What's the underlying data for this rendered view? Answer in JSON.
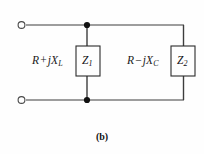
{
  "figure": {
    "caption": "(b)",
    "background_color": "#fefefe",
    "wire_color": "#3d3d3d",
    "box_border_color": "#2b2b2b",
    "text_color": "#111111"
  },
  "branches": [
    {
      "id": "branch-1",
      "impedance_expression": {
        "resistance": "R",
        "operator": "+",
        "reactance_symbol": "jX",
        "reactance_subscript": "L",
        "full_text": "R + jX_L"
      },
      "box_label": {
        "symbol": "Z",
        "subscript": "1",
        "full_text": "Z₁"
      }
    },
    {
      "id": "branch-2",
      "impedance_expression": {
        "resistance": "R",
        "operator": "−",
        "reactance_symbol": "jX",
        "reactance_subscript": "C",
        "full_text": "R − jX_C"
      },
      "box_label": {
        "symbol": "Z",
        "subscript": "2",
        "full_text": "Z₂"
      }
    }
  ],
  "terminals": [
    {
      "name": "terminal-top-left",
      "x": 21,
      "y": 25,
      "style": "open-circle"
    },
    {
      "name": "terminal-bottom-left",
      "x": 21,
      "y": 100,
      "style": "open-circle"
    }
  ],
  "junctions": [
    {
      "name": "junction-top",
      "x": 87,
      "y": 25,
      "style": "filled-dot"
    },
    {
      "name": "junction-bottom",
      "x": 87,
      "y": 100,
      "style": "filled-dot"
    }
  ],
  "boxes": [
    {
      "name": "impedance-box-z1",
      "x": 76,
      "y": 46,
      "width": 24,
      "height": 30
    },
    {
      "name": "impedance-box-z2",
      "x": 171,
      "y": 46,
      "width": 24,
      "height": 30
    }
  ]
}
